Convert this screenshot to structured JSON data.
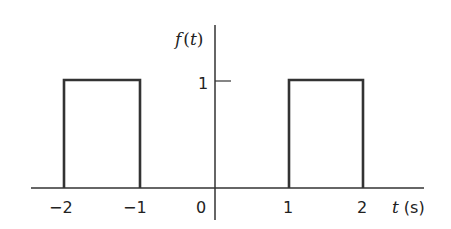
{
  "diagram": {
    "title": "f(t)",
    "y_axis_label": {
      "func": "f",
      "open": "(",
      "var": "t",
      "close": ")"
    },
    "x_axis_label": {
      "var": "t",
      "unit": "(s)"
    },
    "y_ticks": [
      {
        "value": 1,
        "label": "1"
      }
    ],
    "x_ticks": [
      {
        "value": -2,
        "label": "−2"
      },
      {
        "value": -1,
        "label": "−1"
      },
      {
        "value": 0,
        "label": "0"
      },
      {
        "value": 1,
        "label": "1"
      },
      {
        "value": 2,
        "label": "2"
      }
    ],
    "pulses": [
      {
        "start": -2,
        "end": -1,
        "amplitude": 1
      },
      {
        "start": 1,
        "end": 2,
        "amplitude": 1
      }
    ],
    "line_color": "#333333"
  }
}
